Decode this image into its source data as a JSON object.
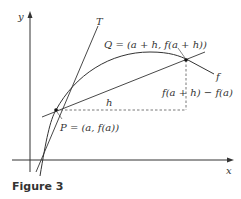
{
  "figure": {
    "caption": "Figure 3",
    "axes": {
      "x_label": "x",
      "y_label": "y"
    },
    "labels": {
      "tangent": "T",
      "curve": "f",
      "point_p": "P = (a, f(a))",
      "point_q": "Q = (a + h, f(a + h))",
      "run": "h",
      "rise": "f(a + h) − f(a)"
    },
    "colors": {
      "stroke": "#333333",
      "dashed": "#555555",
      "background": "#ffffff"
    }
  }
}
